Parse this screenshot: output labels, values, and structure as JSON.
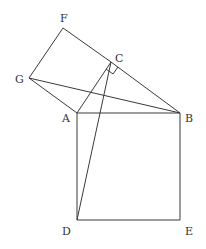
{
  "diagram": {
    "type": "geometry",
    "points": {
      "A": {
        "label": "A",
        "x": 77,
        "y": 113
      },
      "B": {
        "label": "B",
        "x": 180,
        "y": 113
      },
      "C": {
        "label": "C",
        "x": 111,
        "y": 62
      },
      "D": {
        "label": "D",
        "x": 77,
        "y": 220
      },
      "E": {
        "label": "E",
        "x": 180,
        "y": 220
      },
      "F": {
        "label": "F",
        "x": 63,
        "y": 28
      },
      "G": {
        "label": "G",
        "x": 29,
        "y": 78
      }
    },
    "segments": [
      "AB",
      "BE",
      "ED",
      "DA",
      "AC",
      "CB",
      "CF",
      "FG",
      "GA",
      "GB",
      "CD"
    ],
    "right_angle_marker": "C",
    "stroke_color": "#3a3a3a"
  }
}
